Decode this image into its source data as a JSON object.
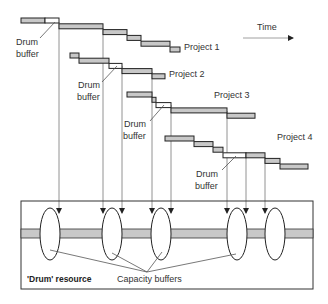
{
  "time_label": "Time",
  "drum_buffer_label_line1": "Drum",
  "drum_buffer_label_line2": "buffer",
  "drum_resource_label": "'Drum' resource",
  "capacity_buffers_label": "Capacity buffers",
  "colors": {
    "task_fill": "#c8c8c8",
    "buffer_fill": "#ffffff",
    "outline": "#222222",
    "belt_fill": "#c8c8c8"
  },
  "projects": [
    {
      "name": "Project 1",
      "tasks": [
        {
          "x0": 21,
          "x1": 45,
          "row": 0,
          "type": "task"
        },
        {
          "x0": 45,
          "x1": 59,
          "row": 0,
          "type": "buffer"
        },
        {
          "x0": 59,
          "x1": 103,
          "row": 1,
          "type": "task"
        },
        {
          "x0": 103,
          "x1": 127,
          "row": 2,
          "type": "task"
        },
        {
          "x0": 127,
          "x1": 141,
          "row": 3,
          "type": "task"
        },
        {
          "x0": 141,
          "x1": 170,
          "row": 4,
          "type": "task"
        },
        {
          "x0": 170,
          "x1": 180,
          "row": 5,
          "type": "task"
        }
      ]
    },
    {
      "name": "Project 2",
      "tasks": [
        {
          "x0": 70,
          "x1": 79,
          "row": 0,
          "type": "task"
        },
        {
          "x0": 79,
          "x1": 109,
          "row": 1,
          "type": "task"
        },
        {
          "x0": 109,
          "x1": 122,
          "row": 2,
          "type": "buffer"
        },
        {
          "x0": 122,
          "x1": 152,
          "row": 3,
          "type": "task"
        },
        {
          "x0": 152,
          "x1": 165,
          "row": 4,
          "type": "task"
        }
      ]
    },
    {
      "name": "Project 3",
      "tasks": [
        {
          "x0": 127,
          "x1": 152,
          "row": 0,
          "type": "task"
        },
        {
          "x0": 152,
          "x1": 156,
          "row": 1,
          "type": "task"
        },
        {
          "x0": 156,
          "x1": 171,
          "row": 2,
          "type": "buffer"
        },
        {
          "x0": 171,
          "x1": 227,
          "row": 3,
          "type": "task"
        },
        {
          "x0": 227,
          "x1": 255,
          "row": 4,
          "type": "task"
        }
      ]
    },
    {
      "name": "Project 4",
      "tasks": [
        {
          "x0": 165,
          "x1": 194,
          "row": 0,
          "type": "task"
        },
        {
          "x0": 194,
          "x1": 213,
          "row": 1,
          "type": "task"
        },
        {
          "x0": 213,
          "x1": 223,
          "row": 2,
          "type": "task"
        },
        {
          "x0": 223,
          "x1": 246,
          "row": 3,
          "type": "buffer"
        },
        {
          "x0": 246,
          "x1": 265,
          "row": 3,
          "type": "task"
        },
        {
          "x0": 265,
          "x1": 280,
          "row": 4,
          "type": "task"
        },
        {
          "x0": 280,
          "x1": 308,
          "row": 5,
          "type": "task"
        }
      ]
    }
  ],
  "capacity_buffer_count": 5
}
